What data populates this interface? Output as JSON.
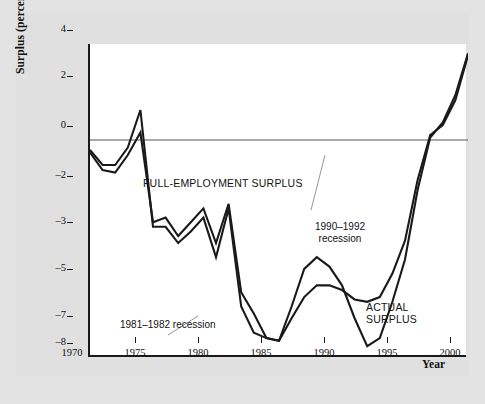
{
  "figure": {
    "background_color": "#e0e0e0",
    "plot_background_color": "#ffffff",
    "line_color": "#1a1a1a",
    "zero_line_color": "#555555"
  },
  "annotations": {
    "full_employment_label": "FULL-EMPLOYMENT SURPLUS",
    "actual_label": "ACTUAL\nSURPLUS",
    "recession_1981": "1981–1982 recession",
    "recession_1990": "1990–1992\nrecession"
  },
  "chart_data": {
    "type": "line",
    "title": "",
    "xlabel": "Year",
    "ylabel": "Surplus (percent of GDP)",
    "xlim": [
      1970,
      2000
    ],
    "ylim": [
      -8,
      4
    ],
    "grid": false,
    "legend": "inline-annotations",
    "xticks": [
      1970,
      1975,
      1980,
      1985,
      1990,
      1995,
      2000
    ],
    "yticks": [
      4,
      2,
      0,
      -2,
      -3,
      -5,
      -7,
      -8
    ],
    "ytick_labels": [
      "4",
      "2",
      "0",
      "–2",
      "–3",
      "–5",
      "–7",
      "–8"
    ],
    "y_axis_note": "non-uniform spacing: 4,2,0,-2 evenly spaced then -3,-5,-7,-8",
    "series": [
      {
        "name": "FULL-EMPLOYMENT SURPLUS",
        "x": [
          1970,
          1971,
          1972,
          1973,
          1974,
          1975,
          1976,
          1977,
          1978,
          1979,
          1980,
          1981,
          1982,
          1983,
          1984,
          1985,
          1986,
          1987,
          1988,
          1989,
          1990,
          1991,
          1992,
          1993,
          1994,
          1995,
          1996,
          1997,
          1998,
          1999,
          2000
        ],
        "values": [
          -0.5,
          -1.2,
          -1.3,
          -0.6,
          0.3,
          -2.7,
          -2.6,
          -3.0,
          -2.7,
          -2.4,
          -3.3,
          -2.3,
          -5.4,
          -6.3,
          -7.3,
          -7.4,
          -6.5,
          -5.6,
          -5.1,
          -5.1,
          -5.3,
          -5.7,
          -5.8,
          -5.6,
          -4.6,
          -3.2,
          -1.6,
          0.2,
          0.6,
          1.6,
          3.5
        ]
      },
      {
        "name": "ACTUAL SURPLUS",
        "x": [
          1970,
          1971,
          1972,
          1973,
          1974,
          1975,
          1976,
          1977,
          1978,
          1979,
          1980,
          1981,
          1982,
          1983,
          1984,
          1985,
          1986,
          1987,
          1988,
          1989,
          1990,
          1991,
          1992,
          1993,
          1994,
          1995,
          1996,
          1997,
          1998,
          1999,
          2000
        ],
        "values": [
          -0.4,
          -1.0,
          -1.0,
          -0.3,
          1.2,
          -2.8,
          -2.8,
          -3.3,
          -2.9,
          -2.6,
          -3.9,
          -2.4,
          -6.0,
          -7.1,
          -7.3,
          -7.4,
          -6.0,
          -4.4,
          -3.9,
          -4.3,
          -5.1,
          -6.5,
          -7.6,
          -7.3,
          -5.8,
          -4.0,
          -2.0,
          0.1,
          0.7,
          1.8,
          3.6
        ]
      }
    ]
  }
}
